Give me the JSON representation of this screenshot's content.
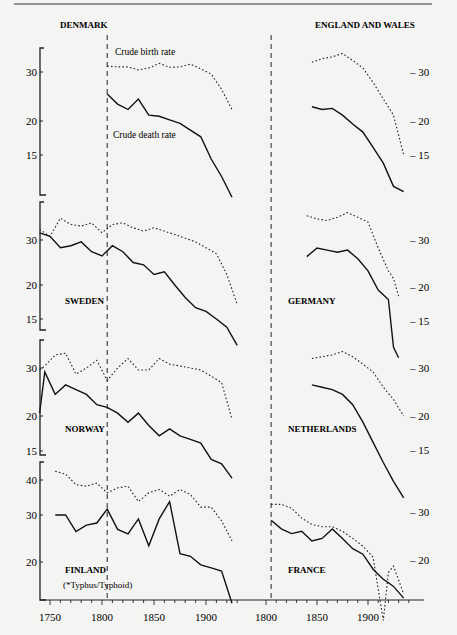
{
  "page": {
    "top_rule": true
  },
  "chart_data": {
    "type": "line",
    "xlabel": "",
    "ylabel": "Rate per 1000",
    "x_ticks": {
      "left": [
        "1750",
        "1800",
        "1850",
        "1900"
      ],
      "right": [
        "1800",
        "1850",
        "1900"
      ]
    },
    "annotations": {
      "birth_label": "Crude birth rate",
      "death_label": "Crude death rate",
      "finland_note": "(*Typhus/Typhoid)"
    },
    "legend": [
      {
        "name": "Crude birth rate",
        "style": "dotted"
      },
      {
        "name": "Crude death rate",
        "style": "solid"
      }
    ],
    "panels": [
      {
        "country": "DENMARK",
        "side": "left",
        "y_ticks": [
          "30",
          "20",
          "15"
        ],
        "x": [
          1805,
          1815,
          1825,
          1835,
          1845,
          1855,
          1865,
          1875,
          1885,
          1895,
          1905,
          1915,
          1925
        ],
        "birth": [
          31.5,
          31.3,
          31.3,
          30.5,
          31.0,
          32.2,
          31.2,
          31.3,
          32.0,
          30.8,
          29.5,
          26.0,
          22.0
        ],
        "death": [
          25.0,
          23.0,
          22.0,
          24.0,
          21.0,
          20.8,
          20.2,
          19.6,
          18.5,
          17.5,
          14.5,
          12.5,
          10.5
        ]
      },
      {
        "country": "ENGLAND AND WALES",
        "side": "right",
        "y_ticks": [
          "30",
          "20",
          "15"
        ],
        "x": [
          1845,
          1855,
          1865,
          1875,
          1885,
          1895,
          1905,
          1915,
          1925,
          1935
        ],
        "birth": [
          32.5,
          33.5,
          34.0,
          35.0,
          33.0,
          31.0,
          27.5,
          24.0,
          21.0,
          15.0
        ],
        "death": [
          22.5,
          22.0,
          22.2,
          21.0,
          19.5,
          18.2,
          16.0,
          14.0,
          11.5,
          11.0
        ]
      },
      {
        "country": "SWEDEN",
        "side": "left",
        "y_ticks": [
          "30",
          "20",
          "15"
        ],
        "x": [
          1740,
          1750,
          1760,
          1770,
          1780,
          1790,
          1800,
          1810,
          1820,
          1830,
          1840,
          1850,
          1860,
          1870,
          1880,
          1890,
          1900,
          1910,
          1920,
          1930
        ],
        "birth": [
          33.0,
          31.0,
          36.5,
          34.5,
          34.0,
          35.0,
          32.0,
          34.5,
          35.0,
          33.5,
          32.5,
          33.5,
          32.5,
          31.5,
          30.5,
          29.5,
          28.0,
          26.5,
          22.0,
          17.0
        ],
        "death": [
          32.0,
          31.0,
          28.0,
          28.5,
          29.5,
          27.0,
          26.0,
          28.5,
          27.0,
          24.5,
          24.0,
          22.0,
          22.5,
          20.0,
          18.0,
          16.5,
          16.0,
          15.0,
          14.0,
          12.0
        ]
      },
      {
        "country": "GERMANY",
        "side": "right",
        "y_ticks": [
          "30",
          "20",
          "15"
        ],
        "x": [
          1840,
          1850,
          1860,
          1870,
          1880,
          1890,
          1900,
          1910,
          1920,
          1925,
          1930
        ],
        "birth": [
          37.0,
          36.0,
          35.5,
          36.5,
          38.0,
          36.5,
          35.0,
          28.0,
          23.0,
          21.5,
          18.5
        ],
        "death": [
          26.0,
          28.0,
          27.5,
          27.0,
          27.5,
          25.5,
          23.0,
          19.5,
          18.0,
          12.0,
          11.0
        ]
      },
      {
        "country": "NORWAY",
        "side": "left",
        "y_ticks": [
          "30",
          "20",
          "15"
        ],
        "x": [
          1740,
          1745,
          1755,
          1765,
          1775,
          1785,
          1795,
          1805,
          1815,
          1825,
          1835,
          1845,
          1855,
          1865,
          1875,
          1885,
          1895,
          1905,
          1915,
          1925
        ],
        "birth": [
          29.5,
          30.5,
          33.5,
          34.0,
          28.5,
          30.0,
          32.0,
          27.0,
          30.0,
          32.5,
          29.5,
          29.5,
          32.5,
          31.0,
          30.5,
          30.0,
          29.5,
          28.0,
          26.5,
          19.5
        ],
        "death": [
          20.5,
          29.0,
          24.0,
          26.0,
          25.0,
          24.0,
          22.0,
          21.5,
          20.5,
          19.0,
          20.5,
          18.5,
          17.0,
          18.0,
          17.0,
          16.5,
          16.0,
          14.0,
          13.5,
          12.0
        ]
      },
      {
        "country": "NETHERLANDS",
        "side": "right",
        "y_ticks": [
          "30",
          "20",
          "15"
        ],
        "x": [
          1845,
          1855,
          1865,
          1875,
          1885,
          1895,
          1905,
          1915,
          1925,
          1935
        ],
        "birth": [
          32.5,
          33.0,
          33.5,
          34.5,
          33.0,
          31.0,
          29.0,
          25.5,
          23.0,
          20.0
        ],
        "death": [
          26.0,
          25.5,
          25.0,
          24.0,
          22.0,
          19.0,
          16.0,
          13.5,
          11.5,
          10.0
        ]
      },
      {
        "country": "FINLAND",
        "side": "left",
        "y_ticks": [
          "40",
          "30",
          "20"
        ],
        "x": [
          1755,
          1765,
          1775,
          1785,
          1795,
          1805,
          1815,
          1825,
          1835,
          1845,
          1855,
          1865,
          1875,
          1885,
          1895,
          1905,
          1915,
          1925
        ],
        "birth": [
          43.0,
          42.0,
          38.5,
          38.0,
          39.0,
          36.0,
          37.5,
          38.0,
          33.5,
          36.0,
          37.0,
          35.0,
          37.0,
          35.5,
          32.0,
          32.0,
          28.5,
          24.0
        ],
        "death": [
          30.0,
          30.0,
          26.0,
          27.5,
          28.0,
          31.5,
          26.5,
          25.5,
          29.0,
          23.0,
          29.0,
          33.5,
          21.5,
          21.0,
          19.5,
          19.0,
          18.5,
          14.0
        ]
      },
      {
        "country": "FRANCE",
        "side": "right",
        "y_ticks": [
          "30",
          "20"
        ],
        "x": [
          1805,
          1815,
          1825,
          1835,
          1845,
          1855,
          1865,
          1875,
          1885,
          1895,
          1905,
          1915,
          1920,
          1925,
          1935
        ],
        "birth": [
          32.0,
          32.0,
          31.0,
          28.5,
          27.0,
          26.5,
          26.5,
          25.5,
          24.0,
          22.5,
          20.5,
          12.0,
          18.0,
          19.0,
          15.0
        ],
        "death": [
          28.0,
          26.0,
          25.0,
          25.5,
          23.5,
          24.0,
          26.0,
          24.0,
          22.0,
          21.0,
          18.5,
          17.0,
          16.5,
          16.0,
          14.5
        ]
      }
    ],
    "reference_line": {
      "x": 1805,
      "style": "dashed"
    },
    "grid": false
  }
}
